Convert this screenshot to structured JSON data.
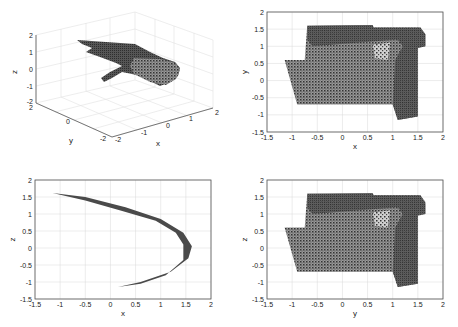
{
  "figure": {
    "background": "#ffffff",
    "point_color": "#3a3a3a",
    "grid_color": "#d8d8d8",
    "axis_color": "#555555"
  },
  "chart_data": [
    {
      "id": "plot-3d",
      "type": "scatter",
      "title": "",
      "projection": "3d",
      "xlabel": "x",
      "ylabel": "y",
      "zlabel": "z",
      "xlim": [
        -2,
        2
      ],
      "ylim": [
        -2,
        2
      ],
      "zlim": [
        -2,
        2
      ],
      "xticks": [
        "-2",
        "-1",
        "0",
        "1",
        "2"
      ],
      "yticks": [
        "-2",
        "0",
        "2"
      ],
      "zticks": [
        "-2",
        "-1",
        "0",
        "1",
        "2"
      ],
      "grid": true,
      "description": "3D point cloud forming a bent hand-like surface: a flat upper lobe sweeping from upper-left, a cylindrical lower-right body, and a thin finger protruding toward lower-left."
    },
    {
      "id": "plot-xy",
      "type": "scatter",
      "title": "",
      "xlabel": "x",
      "ylabel": "y",
      "xlim": [
        -1.5,
        2
      ],
      "ylim": [
        -1.5,
        2
      ],
      "xticks": [
        "-1.5",
        "-1",
        "-0.5",
        "0",
        "0.5",
        "1",
        "1.5",
        "2"
      ],
      "yticks": [
        "-1.5",
        "-1",
        "-0.5",
        "0",
        "0.5",
        "1",
        "1.5",
        "2"
      ],
      "grid": true,
      "regions": [
        {
          "name": "upper-band",
          "polygon": [
            [
              -0.7,
              1.6
            ],
            [
              0.6,
              1.62
            ],
            [
              0.62,
              1.55
            ],
            [
              1.55,
              1.55
            ],
            [
              1.65,
              1.35
            ],
            [
              1.65,
              1.0
            ],
            [
              1.5,
              0.95
            ],
            [
              1.5,
              -1.05
            ],
            [
              1.1,
              -1.15
            ],
            [
              1.0,
              -0.7
            ],
            [
              -0.9,
              -0.7
            ],
            [
              -1.15,
              0.6
            ],
            [
              -0.75,
              0.6
            ],
            [
              -0.7,
              1.6
            ]
          ]
        }
      ],
      "extent": {
        "x": [
          -1.15,
          1.65
        ],
        "y": [
          -1.15,
          1.62
        ]
      }
    },
    {
      "id": "plot-xz",
      "type": "scatter",
      "title": "",
      "xlabel": "x",
      "ylabel": "z",
      "xlim": [
        -1.5,
        2
      ],
      "ylim": [
        -1.5,
        2
      ],
      "xticks": [
        "-1.5",
        "-1",
        "-0.5",
        "0",
        "0.5",
        "1",
        "1.5",
        "2"
      ],
      "yticks": [
        "-1.5",
        "-1",
        "-0.5",
        "0",
        "0.5",
        "1",
        "1.5",
        "2"
      ],
      "grid": true,
      "curve": {
        "outer": [
          [
            -1.15,
            1.62
          ],
          [
            -0.5,
            1.5
          ],
          [
            0.3,
            1.2
          ],
          [
            1.0,
            0.85
          ],
          [
            1.45,
            0.45
          ],
          [
            1.62,
            0.05
          ],
          [
            1.55,
            -0.3
          ],
          [
            1.2,
            -0.7
          ],
          [
            0.6,
            -1.0
          ],
          [
            0.15,
            -1.15
          ]
        ],
        "inner": [
          [
            0.15,
            -1.15
          ],
          [
            0.6,
            -1.05
          ],
          [
            1.1,
            -0.8
          ],
          [
            1.45,
            -0.35
          ],
          [
            1.45,
            0.1
          ],
          [
            1.3,
            0.45
          ],
          [
            0.9,
            0.8
          ],
          [
            0.2,
            1.1
          ],
          [
            -0.5,
            1.4
          ],
          [
            -1.15,
            1.62
          ]
        ]
      },
      "extent": {
        "x": [
          -1.15,
          1.62
        ],
        "z": [
          -1.15,
          1.62
        ]
      }
    },
    {
      "id": "plot-yz",
      "type": "scatter",
      "title": "",
      "xlabel": "y",
      "ylabel": "z",
      "xlim": [
        -1.5,
        2
      ],
      "ylim": [
        -1.5,
        2
      ],
      "xticks": [
        "-1.5",
        "-1",
        "-0.5",
        "0",
        "0.5",
        "1",
        "1.5",
        "2"
      ],
      "yticks": [
        "-1.5",
        "-1",
        "-0.5",
        "0",
        "0.5",
        "1",
        "1.5",
        "2"
      ],
      "grid": true,
      "regions": [
        {
          "name": "body",
          "polygon": [
            [
              -0.7,
              1.58
            ],
            [
              0.6,
              1.6
            ],
            [
              0.62,
              1.55
            ],
            [
              1.55,
              1.55
            ],
            [
              1.65,
              1.3
            ],
            [
              1.65,
              1.0
            ],
            [
              1.5,
              0.98
            ],
            [
              1.5,
              -1.05
            ],
            [
              1.1,
              -1.15
            ],
            [
              1.0,
              -0.7
            ],
            [
              -0.9,
              -0.7
            ],
            [
              -1.15,
              0.6
            ],
            [
              -0.75,
              0.6
            ],
            [
              -0.7,
              1.58
            ]
          ]
        }
      ],
      "extent": {
        "y": [
          -1.15,
          1.65
        ],
        "z": [
          -1.15,
          1.6
        ]
      }
    }
  ]
}
